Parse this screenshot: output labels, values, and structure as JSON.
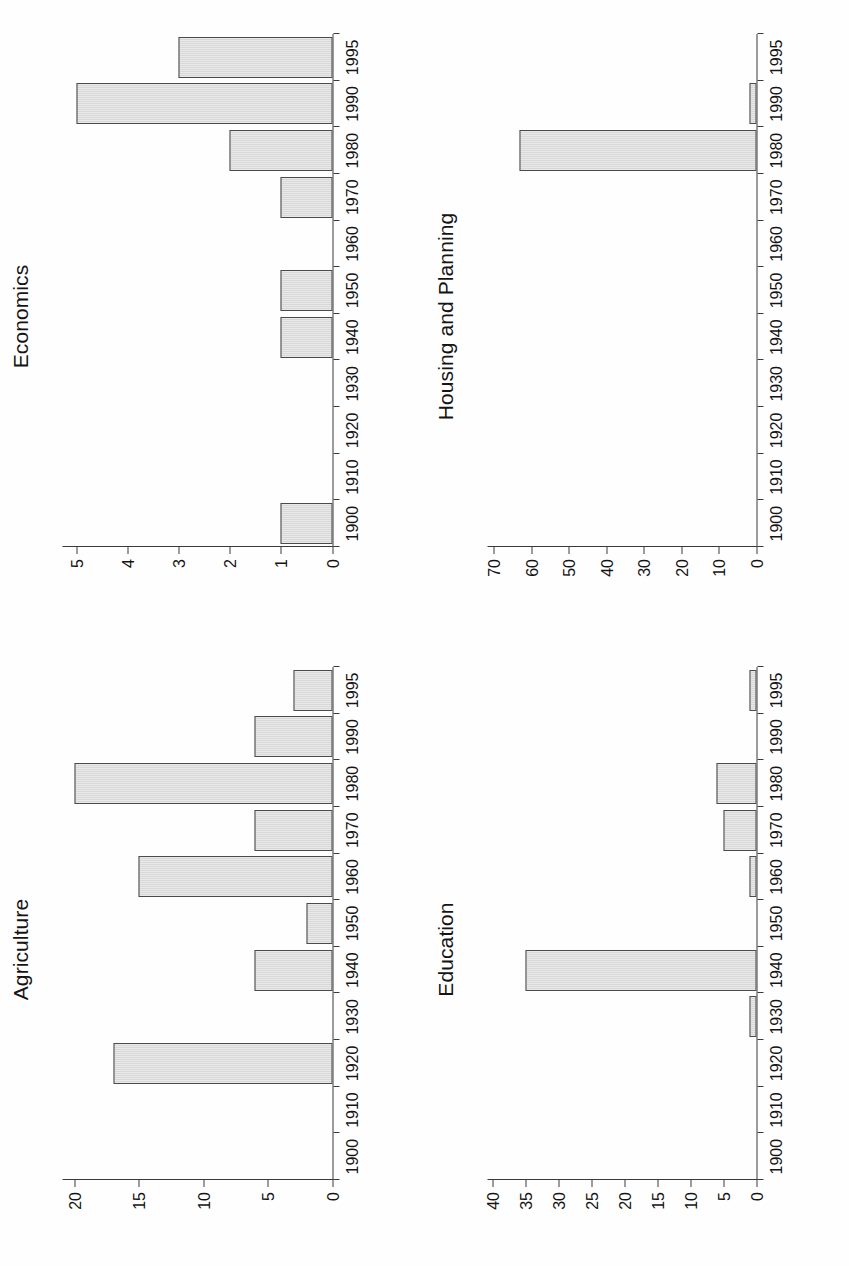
{
  "figure": {
    "orientation": "rotated-90-ccw",
    "background_color": "#fefefe",
    "bar_fill_color": "#c9c9c9",
    "bar_border_color": "#4a4a4a",
    "axis_color": "#3a3a3a"
  },
  "panels": [
    {
      "id": "agriculture",
      "title": "Agriculture"
    },
    {
      "id": "economics",
      "title": "Economics"
    },
    {
      "id": "education",
      "title": "Education"
    },
    {
      "id": "housing-and-planning",
      "title": "Housing and Planning"
    }
  ],
  "chart_data": [
    {
      "type": "bar",
      "title": "Agriculture",
      "xlabel": "",
      "ylabel": "",
      "grid": false,
      "legend": "none",
      "categories": [
        "1900",
        "1910",
        "1920",
        "1930",
        "1940",
        "1950",
        "1960",
        "1970",
        "1980",
        "1990",
        "1995"
      ],
      "values": [
        0,
        0,
        17,
        0,
        6,
        2,
        15,
        6,
        20,
        6,
        3
      ],
      "xtick_labels": [
        "1900",
        "1910",
        "1920",
        "1930",
        "1940",
        "1950",
        "1960",
        "1970",
        "1980",
        "1990",
        "1995"
      ],
      "ytick_labels": [
        "0",
        "5",
        "10",
        "15",
        "20"
      ],
      "ytick_values": [
        0,
        5,
        10,
        15,
        20
      ],
      "ylim": [
        0,
        21
      ]
    },
    {
      "type": "bar",
      "title": "Economics",
      "xlabel": "",
      "ylabel": "",
      "grid": false,
      "legend": "none",
      "categories": [
        "1900",
        "1910",
        "1920",
        "1930",
        "1940",
        "1950",
        "1960",
        "1970",
        "1980",
        "1990",
        "1995"
      ],
      "values": [
        1,
        0,
        0,
        0,
        1,
        1,
        0,
        1,
        2,
        5,
        3
      ],
      "xtick_labels": [
        "1900",
        "1910",
        "1920",
        "1930",
        "1940",
        "1950",
        "1960",
        "1970",
        "1980",
        "1990",
        "1995"
      ],
      "ytick_labels": [
        "0",
        "1",
        "2",
        "3",
        "4",
        "5"
      ],
      "ytick_values": [
        0,
        1,
        2,
        3,
        4,
        5
      ],
      "ylim": [
        0,
        5.3
      ]
    },
    {
      "type": "bar",
      "title": "Education",
      "xlabel": "",
      "ylabel": "",
      "grid": false,
      "legend": "none",
      "categories": [
        "1900",
        "1910",
        "1920",
        "1930",
        "1940",
        "1950",
        "1960",
        "1970",
        "1980",
        "1990",
        "1995"
      ],
      "values": [
        0,
        0,
        0,
        1,
        35,
        0,
        1,
        5,
        6,
        0,
        1
      ],
      "xtick_labels": [
        "1900",
        "1910",
        "1920",
        "1930",
        "1940",
        "1950",
        "1960",
        "1970",
        "1980",
        "1990",
        "1995"
      ],
      "ytick_labels": [
        "0",
        "5",
        "10",
        "15",
        "20",
        "25",
        "30",
        "35",
        "40"
      ],
      "ytick_values": [
        0,
        5,
        10,
        15,
        20,
        25,
        30,
        35,
        40
      ],
      "ylim": [
        0,
        41
      ]
    },
    {
      "type": "bar",
      "title": "Housing and Planning",
      "xlabel": "",
      "ylabel": "",
      "grid": false,
      "legend": "none",
      "categories": [
        "1900",
        "1910",
        "1920",
        "1930",
        "1940",
        "1950",
        "1960",
        "1970",
        "1980",
        "1990",
        "1995"
      ],
      "values": [
        0,
        0,
        0,
        0,
        0,
        0,
        0,
        0,
        63,
        2,
        0
      ],
      "xtick_labels": [
        "1900",
        "1910",
        "1920",
        "1930",
        "1940",
        "1950",
        "1960",
        "1970",
        "1980",
        "1990",
        "1995"
      ],
      "ytick_labels": [
        "0",
        "10",
        "20",
        "30",
        "40",
        "50",
        "60",
        "70"
      ],
      "ytick_values": [
        0,
        10,
        20,
        30,
        40,
        50,
        60,
        70
      ],
      "ylim": [
        0,
        72
      ]
    }
  ]
}
